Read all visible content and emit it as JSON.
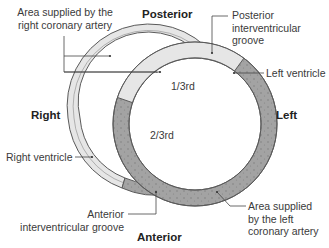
{
  "diagram": {
    "orientation": {
      "top": "Posterior",
      "bottom": "Anterior",
      "left": "Right",
      "right": "Left"
    },
    "labels": {
      "rca_area_line1": "Area supplied by the",
      "rca_area_line2": "right coronary artery",
      "piv_groove_line1": "Posterior",
      "piv_groove_line2": "interventricular",
      "piv_groove_line3": "groove",
      "left_ventricle": "Left ventricle",
      "right_ventricle": "Right ventricle",
      "aiv_groove_line1": "Anterior",
      "aiv_groove_line2": "interventricular groove",
      "lca_area_line1": "Area supplied",
      "lca_area_line2": "by the left",
      "lca_area_line3": "coronary artery",
      "fraction_rca": "1/3rd",
      "fraction_lca": "2/3rd"
    },
    "colors": {
      "rca_region": "#e6e6e6",
      "lca_region": "#a3a3a3",
      "outline": "#555555",
      "leader_line": "#444444"
    }
  }
}
